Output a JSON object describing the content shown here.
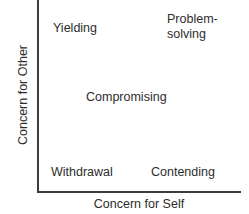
{
  "figure": {
    "name": "dual-concern-model",
    "axes": {
      "x_title": "Concern for Self",
      "y_title": "Concern for Other"
    },
    "labels": {
      "yielding": "Yielding",
      "problem_solving_line1": "Problem-",
      "problem_solving_line2": "solving",
      "compromising": "Compromising",
      "withdrawal": "Withdrawal",
      "contending": "Contending"
    },
    "colors": {
      "axis": "#3d3d3d",
      "text": "#2d2d2d",
      "background": "#ffffff"
    }
  },
  "chart_data": {
    "type": "scatter",
    "title": "",
    "xlabel": "Concern for Self",
    "ylabel": "Concern for Other",
    "xlim": [
      0,
      1
    ],
    "ylim": [
      0,
      1
    ],
    "grid": false,
    "legend": null,
    "annotations": [
      {
        "text": "Yielding",
        "x": 0.12,
        "y": 0.92
      },
      {
        "text": "Problem-solving",
        "x": 0.78,
        "y": 0.93
      },
      {
        "text": "Compromising",
        "x": 0.5,
        "y": 0.52
      },
      {
        "text": "Withdrawal",
        "x": 0.11,
        "y": 0.13
      },
      {
        "text": "Contending",
        "x": 0.73,
        "y": 0.13
      }
    ]
  }
}
